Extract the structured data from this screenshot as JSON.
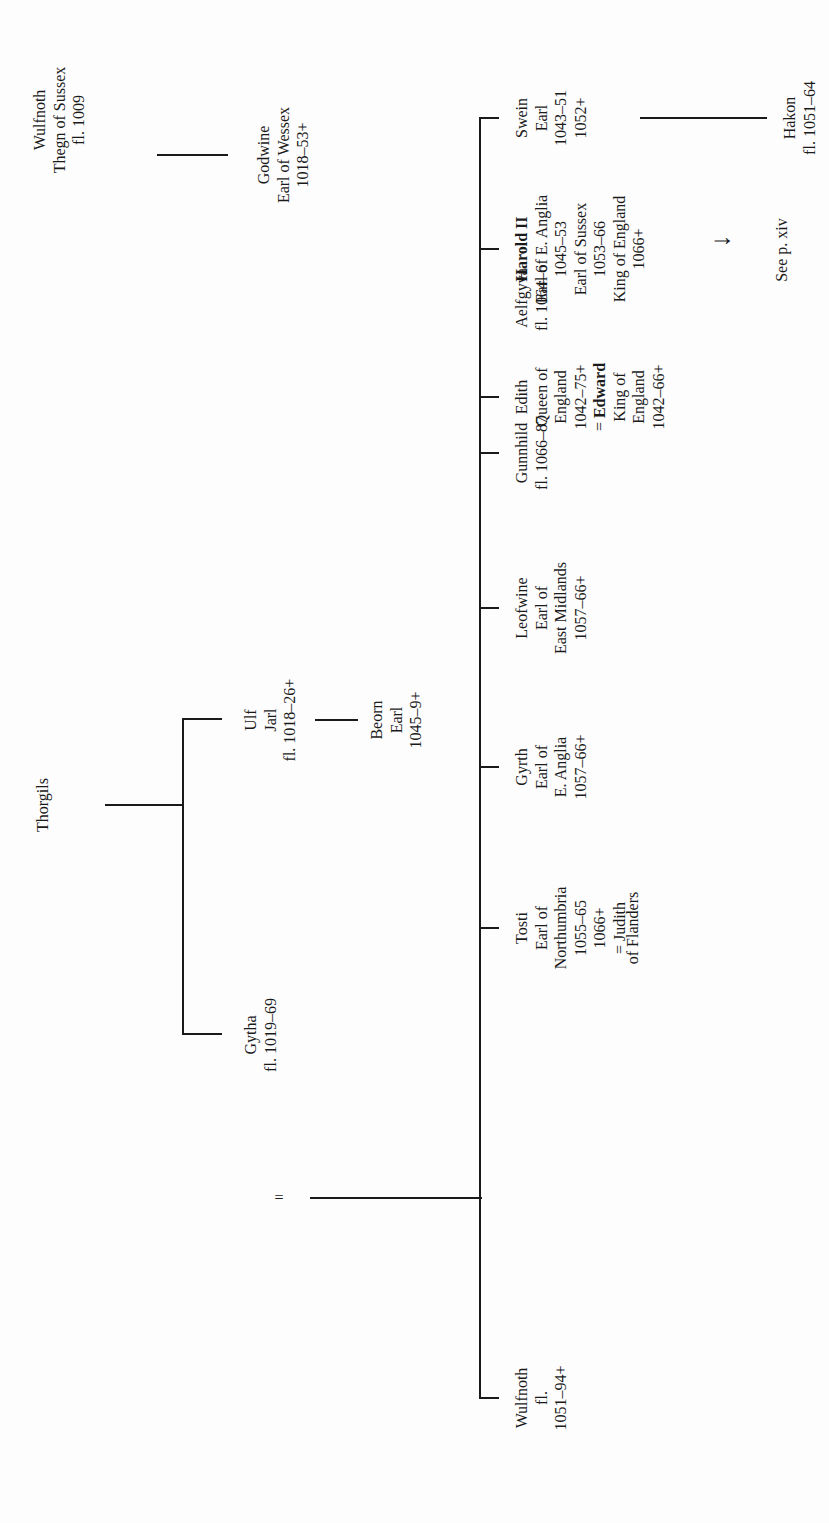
{
  "diagram": {
    "type": "family-tree",
    "orientation": "rotated-90-ccw",
    "generation_1": {
      "wulfnoth_thegn": {
        "lines": [
          "Wulfnoth",
          "Thegn of Sussex",
          "fl. 1009"
        ]
      },
      "thorgils": {
        "lines": [
          "Thorgils"
        ]
      }
    },
    "generation_2": {
      "godwine": {
        "lines": [
          "Godwine",
          "Earl of Wessex",
          "1018–53+"
        ]
      },
      "marriage_symbol": "=",
      "gytha": {
        "lines": [
          "Gytha",
          "fl. 1019–69"
        ]
      },
      "ulf": {
        "lines": [
          "Ulf",
          "Jarl",
          "fl. 1018–26+"
        ]
      },
      "beorn": {
        "lines": [
          "Beorn",
          "Earl",
          "1045–9+"
        ]
      }
    },
    "children": [
      {
        "id": "swein",
        "lines": [
          "Swein",
          "Earl",
          "1043–51",
          "1052+"
        ]
      },
      {
        "id": "harold",
        "name_bold": "Harold II",
        "lines": [
          "Earl of E. Anglia",
          "1045–53",
          "Earl of Sussex",
          "1053–66",
          "King of England",
          "1066+"
        ]
      },
      {
        "id": "edith",
        "lines": [
          "Edith",
          "Queen of",
          "England",
          "1042–75+"
        ],
        "spouse_prefix": "= ",
        "spouse_bold": "Edward",
        "spouse_lines": [
          "King of",
          "England",
          "1042–66+"
        ]
      },
      {
        "id": "tosti",
        "lines": [
          "Tosti",
          "Earl of",
          "Northumbria",
          "1055–65",
          "1066+",
          "= Judith",
          "of Flanders"
        ]
      },
      {
        "id": "gyrth",
        "lines": [
          "Gyrth",
          "Earl of",
          "E. Anglia",
          "1057–66+"
        ]
      },
      {
        "id": "leofwine",
        "lines": [
          "Leofwine",
          "Earl of",
          "East Midlands",
          "1057–66+"
        ]
      },
      {
        "id": "gunnhild",
        "lines": [
          "Gunnhild",
          "fl. 1066–87"
        ]
      },
      {
        "id": "aelfgyva",
        "lines": [
          "Aelfgyva",
          "fl. 1064–6"
        ]
      },
      {
        "id": "wulfnoth_son",
        "lines": [
          "Wulfnoth",
          "fl.",
          "1051–94+"
        ]
      }
    ],
    "grandchildren": {
      "hakon": {
        "lines": [
          "Hakon",
          "fl. 1051–64"
        ]
      },
      "harold_ref": {
        "arrow": "↓",
        "text": "See p. xiv"
      }
    },
    "line_color": "#1a1a1a",
    "background": "#fdfdfd"
  }
}
